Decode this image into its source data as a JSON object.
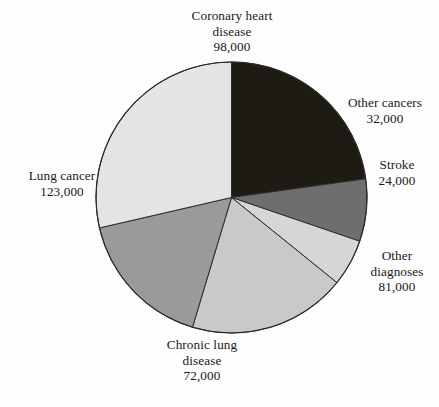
{
  "chart_data": {
    "type": "pie",
    "title": "",
    "subtitle": "",
    "xlabel": "",
    "ylabel": "",
    "legend_position": "none",
    "grid": false,
    "total": 430000,
    "units": "deaths",
    "start_angle_deg": 0,
    "direction": "clockwise",
    "categories": [
      "Coronary heart disease",
      "Other cancers",
      "Stroke",
      "Other diagnoses",
      "Chronic lung disease",
      "Lung cancer"
    ],
    "values": [
      98000,
      32000,
      24000,
      81000,
      72000,
      123000
    ],
    "value_labels": [
      "98,000",
      "32,000",
      "24,000",
      "81,000",
      "72,000",
      "123,000"
    ],
    "colors": [
      "#1e1b14",
      "#6e6e6e",
      "#d6d6d6",
      "#c9c9c9",
      "#9a9a9a",
      "#e4e4e4"
    ],
    "slices": [
      {
        "id": "chd",
        "name_lines": [
          "Coronary heart",
          "disease"
        ],
        "name": "Coronary heart disease",
        "value": 98000,
        "value_label": "98,000",
        "color": "#1e1b14",
        "start_deg": 0,
        "sweep_deg": 82.05,
        "percent": "22.8%"
      },
      {
        "id": "other-cancers",
        "name_lines": [
          "Other cancers"
        ],
        "name": "Other cancers",
        "value": 32000,
        "value_label": "32,000",
        "color": "#6e6e6e",
        "start_deg": 82.05,
        "sweep_deg": 26.79,
        "percent": "7.4%"
      },
      {
        "id": "stroke",
        "name_lines": [
          "Stroke"
        ],
        "name": "Stroke",
        "value": 24000,
        "value_label": "24,000",
        "color": "#d6d6d6",
        "start_deg": 108.84,
        "sweep_deg": 20.09,
        "percent": "5.6%"
      },
      {
        "id": "other-diagnoses",
        "name_lines": [
          "Other",
          "diagnoses"
        ],
        "name": "Other diagnoses",
        "value": 81000,
        "value_label": "81,000",
        "color": "#c9c9c9",
        "start_deg": 128.93,
        "sweep_deg": 67.81,
        "percent": "18.8%"
      },
      {
        "id": "chronic-lung",
        "name_lines": [
          "Chronic lung",
          "disease"
        ],
        "name": "Chronic lung disease",
        "value": 72000,
        "value_label": "72,000",
        "color": "#9a9a9a",
        "start_deg": 196.74,
        "sweep_deg": 60.28,
        "percent": "16.7%"
      },
      {
        "id": "lung-cancer",
        "name_lines": [
          "Lung cancer"
        ],
        "name": "Lung cancer",
        "value": 123000,
        "value_label": "123,000",
        "color": "#e4e4e4",
        "start_deg": 257.02,
        "sweep_deg": 102.98,
        "percent": "28.6%"
      }
    ],
    "geometry": {
      "center_x": 231.5,
      "center_y": 197.5,
      "radius": 135.5,
      "outline_color": "#2b2b2b"
    }
  },
  "labels": {
    "chd": {
      "line1": "Coronary heart",
      "line2": "disease",
      "value": "98,000"
    },
    "other_cancers": {
      "line1": "Other cancers",
      "line2": "",
      "value": "32,000"
    },
    "stroke": {
      "line1": "Stroke",
      "line2": "",
      "value": "24,000"
    },
    "other_diagnoses": {
      "line1": "Other",
      "line2": "diagnoses",
      "value": "81,000"
    },
    "chronic_lung": {
      "line1": "Chronic lung",
      "line2": "disease",
      "value": "72,000"
    },
    "lung_cancer": {
      "line1": "Lung cancer",
      "line2": "",
      "value": "123,000"
    }
  }
}
